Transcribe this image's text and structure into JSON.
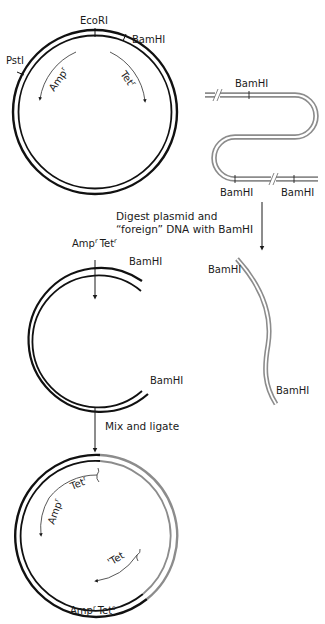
{
  "colors": {
    "plasmid_dna": "#111111",
    "foreign_dna": "#8c8c8c",
    "background": "#ffffff",
    "text": "#1a1a1a"
  },
  "stage1": {
    "plasmid": {
      "sites": {
        "ecori": "EcoRI",
        "bamhi": "BamHI",
        "psti": "PstI"
      },
      "genes": {
        "amp": "Amp",
        "amp_sup": "r",
        "tet": "Tet",
        "tet_sup": "r"
      },
      "phenotype": {
        "amp": "Amp",
        "amp_sup": "r",
        "tet": "Tet",
        "tet_sup": "r"
      }
    },
    "foreign_dna": {
      "sites": [
        "BamHI",
        "BamHI",
        "BamHI"
      ]
    }
  },
  "step1": {
    "line1": "Digest plasmid and",
    "line2": "“foreign” DNA with BamHI"
  },
  "stage2": {
    "cut_plasmid": {
      "top_site": "BamHI",
      "bottom_site": "BamHI"
    },
    "fragment": {
      "top_site": "BamHI",
      "bottom_site": "BamHI"
    }
  },
  "step2": {
    "label": "Mix and ligate"
  },
  "stage3": {
    "genes": {
      "tet": "Tet",
      "tet_sup": "r",
      "amp": "Amp",
      "amp_sup": "r",
      "tet_partial": "'Tet"
    },
    "phenotype": {
      "amp": "Amp",
      "amp_sup": "r",
      "tet": "Tet",
      "tet_sup": "s"
    }
  }
}
